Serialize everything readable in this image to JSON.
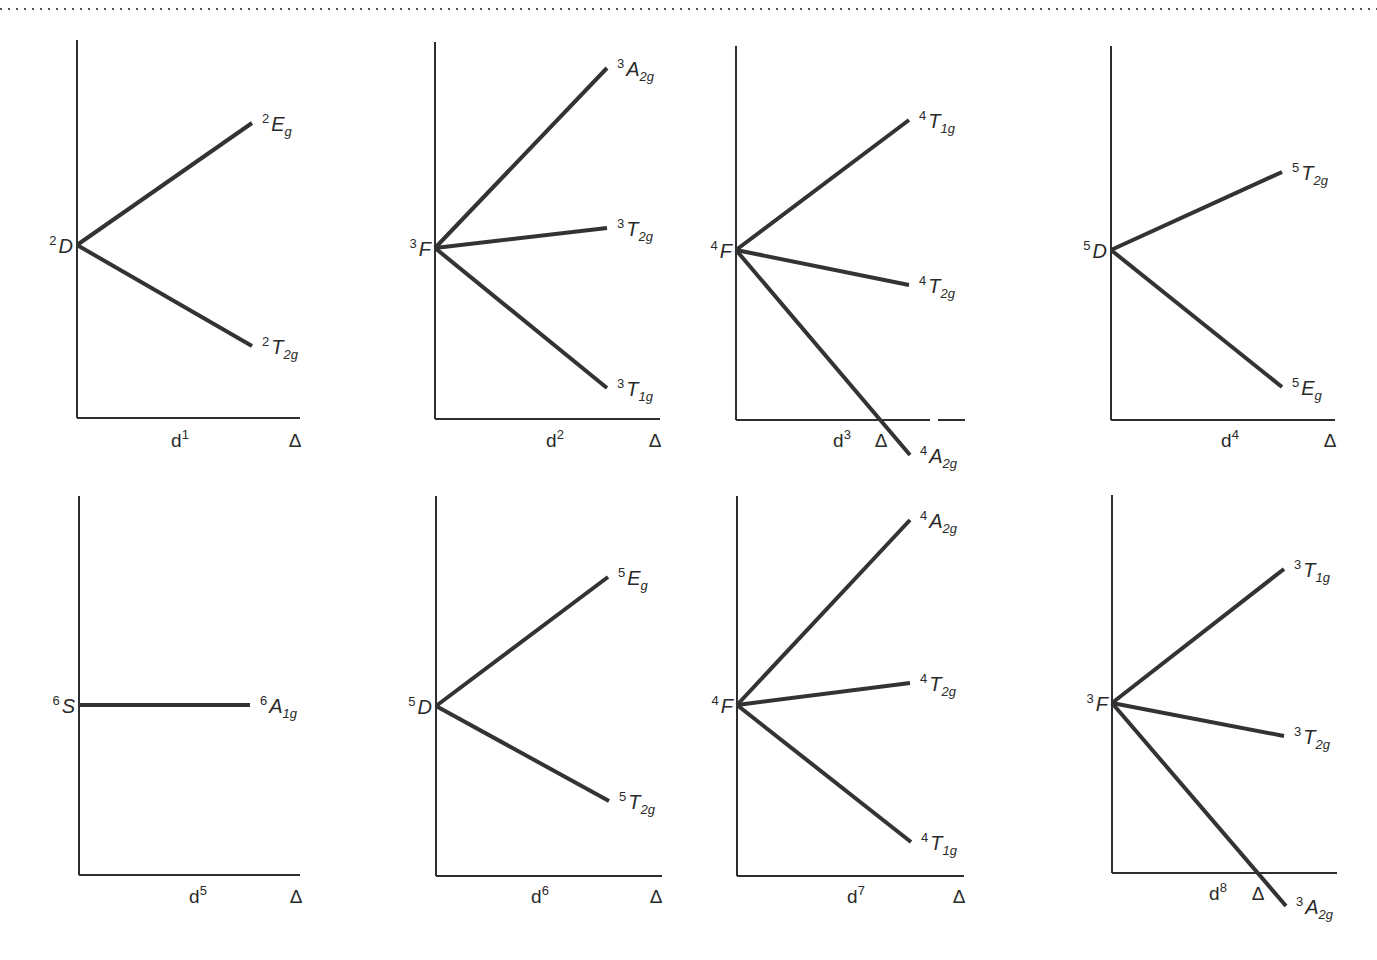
{
  "figure": {
    "type": "Orgel-type correlation diagrams for d1–d8 octahedral complexes",
    "dotted_rule": true,
    "line_color": "#333333",
    "axis_color": "#2e2e2e",
    "text_color": "#2a2a2a",
    "x_axis_symbol": "Δ"
  },
  "panels": [
    {
      "id": "d1",
      "config_base": "d",
      "config_exp": "1",
      "free_ion": {
        "mult": "2",
        "L": "D"
      },
      "axis": {
        "x": 77,
        "top": 40,
        "bottom": 418,
        "right": 300
      },
      "origin_y": 245,
      "cfg_label_x": 180,
      "delta_x": 295,
      "label_y": 447,
      "levels": [
        {
          "mult": "2",
          "sym": "E",
          "sub": "g",
          "end": [
            252,
            123
          ]
        },
        {
          "mult": "2",
          "sym": "T",
          "sub": "2g",
          "end": [
            252,
            346
          ]
        }
      ]
    },
    {
      "id": "d2",
      "config_base": "d",
      "config_exp": "2",
      "free_ion": {
        "mult": "3",
        "L": "F"
      },
      "axis": {
        "x": 435,
        "top": 42,
        "bottom": 419,
        "right": 660
      },
      "origin_y": 248,
      "cfg_label_x": 555,
      "delta_x": 655,
      "label_y": 447,
      "levels": [
        {
          "mult": "3",
          "sym": "A",
          "sub": "2g",
          "end": [
            607,
            68
          ]
        },
        {
          "mult": "3",
          "sym": "T",
          "sub": "2g",
          "end": [
            607,
            228
          ]
        },
        {
          "mult": "3",
          "sym": "T",
          "sub": "1g",
          "end": [
            607,
            388
          ]
        }
      ]
    },
    {
      "id": "d3",
      "config_base": "d",
      "config_exp": "3",
      "free_ion": {
        "mult": "4",
        "L": "F"
      },
      "axis": {
        "x": 736,
        "top": 46,
        "bottom": 420,
        "right": 965,
        "gap": [
          930,
          938
        ]
      },
      "origin_y": 250,
      "cfg_label_x": 842,
      "delta_x": 881,
      "label_y": 447,
      "levels": [
        {
          "mult": "4",
          "sym": "T",
          "sub": "1g",
          "end": [
            909,
            120
          ]
        },
        {
          "mult": "4",
          "sym": "T",
          "sub": "2g",
          "end": [
            909,
            285
          ]
        },
        {
          "mult": "4",
          "sym": "A",
          "sub": "2g",
          "end": [
            910,
            455
          ]
        }
      ]
    },
    {
      "id": "d4",
      "config_base": "d",
      "config_exp": "4",
      "free_ion": {
        "mult": "5",
        "L": "D"
      },
      "axis": {
        "x": 1111,
        "top": 46,
        "bottom": 420,
        "right": 1335
      },
      "origin_y": 250,
      "cfg_label_x": 1230,
      "delta_x": 1330,
      "label_y": 447,
      "levels": [
        {
          "mult": "5",
          "sym": "T",
          "sub": "2g",
          "end": [
            1282,
            172
          ]
        },
        {
          "mult": "5",
          "sym": "E",
          "sub": "g",
          "end": [
            1282,
            387
          ]
        }
      ]
    },
    {
      "id": "d5",
      "config_base": "d",
      "config_exp": "5",
      "free_ion": {
        "mult": "6",
        "L": "S"
      },
      "axis": {
        "x": 79,
        "top": 496,
        "bottom": 875,
        "right": 300
      },
      "origin_y": 705,
      "cfg_label_x": 198,
      "delta_x": 296,
      "label_y": 903,
      "levels": [
        {
          "mult": "6",
          "sym": "A",
          "sub": "1g",
          "end": [
            250,
            705
          ]
        }
      ]
    },
    {
      "id": "d6",
      "config_base": "d",
      "config_exp": "6",
      "free_ion": {
        "mult": "5",
        "L": "D"
      },
      "axis": {
        "x": 436,
        "top": 496,
        "bottom": 876,
        "right": 662
      },
      "origin_y": 706,
      "cfg_label_x": 540,
      "delta_x": 656,
      "label_y": 903,
      "levels": [
        {
          "mult": "5",
          "sym": "E",
          "sub": "g",
          "end": [
            608,
            577
          ]
        },
        {
          "mult": "5",
          "sym": "T",
          "sub": "2g",
          "end": [
            609,
            801
          ]
        }
      ]
    },
    {
      "id": "d7",
      "config_base": "d",
      "config_exp": "7",
      "free_ion": {
        "mult": "4",
        "L": "F"
      },
      "axis": {
        "x": 737,
        "top": 496,
        "bottom": 876,
        "right": 964
      },
      "origin_y": 705,
      "cfg_label_x": 856,
      "delta_x": 959,
      "label_y": 903,
      "levels": [
        {
          "mult": "4",
          "sym": "A",
          "sub": "2g",
          "end": [
            910,
            520
          ]
        },
        {
          "mult": "4",
          "sym": "T",
          "sub": "2g",
          "end": [
            910,
            683
          ]
        },
        {
          "mult": "4",
          "sym": "T",
          "sub": "1g",
          "end": [
            911,
            842
          ]
        }
      ]
    },
    {
      "id": "d8",
      "config_base": "d",
      "config_exp": "8",
      "free_ion": {
        "mult": "3",
        "L": "F"
      },
      "axis": {
        "x": 1112,
        "top": 495,
        "bottom": 873,
        "right": 1337
      },
      "origin_y": 703,
      "cfg_label_x": 1218,
      "delta_x": 1258,
      "label_y": 900,
      "levels": [
        {
          "mult": "3",
          "sym": "T",
          "sub": "1g",
          "end": [
            1284,
            569
          ]
        },
        {
          "mult": "3",
          "sym": "T",
          "sub": "2g",
          "end": [
            1284,
            736
          ]
        },
        {
          "mult": "3",
          "sym": "A",
          "sub": "2g",
          "end": [
            1286,
            906
          ]
        }
      ]
    }
  ]
}
